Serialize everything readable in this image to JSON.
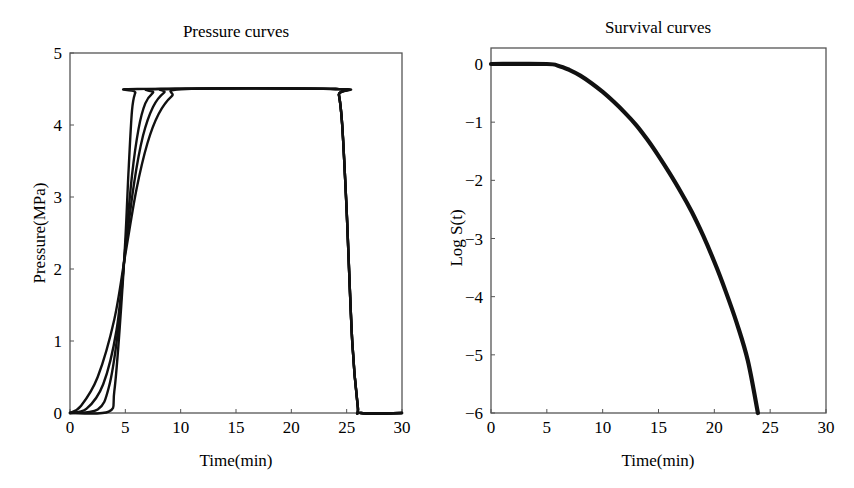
{
  "chart_data": [
    {
      "type": "line",
      "title": "Pressure curves",
      "xlabel": "Time(min)",
      "ylabel": "Pressure(MPa)",
      "xlim": [
        0,
        30
      ],
      "ylim": [
        0,
        5
      ],
      "xticks": [
        0,
        5,
        10,
        15,
        20,
        25,
        30
      ],
      "yticks": [
        0,
        1,
        2,
        3,
        4,
        5
      ],
      "grid": false,
      "legend": null,
      "series": [
        {
          "name": "curve 1 (fastest ramp)",
          "x": [
            0,
            3.5,
            4.0,
            4.5,
            5.0,
            5.3,
            5.6,
            5.9,
            6.2,
            24.0,
            24.3,
            24.6,
            25.0,
            25.5,
            26.0,
            26.3,
            30
          ],
          "y": [
            0,
            0.02,
            0.3,
            1.2,
            2.4,
            3.4,
            4.2,
            4.45,
            4.5,
            4.5,
            4.42,
            4.0,
            2.8,
            1.0,
            0.1,
            0,
            0
          ]
        },
        {
          "name": "curve 2",
          "x": [
            0,
            2.5,
            3.5,
            4.3,
            5.0,
            5.6,
            6.2,
            6.8,
            7.5,
            8.2,
            24.0,
            24.3,
            24.6,
            25.0,
            25.5,
            26.0,
            26.3,
            30
          ],
          "y": [
            0,
            0.05,
            0.35,
            1.1,
            2.3,
            3.3,
            3.95,
            4.3,
            4.45,
            4.5,
            4.5,
            4.42,
            4.0,
            2.8,
            1.0,
            0.1,
            0,
            0
          ]
        },
        {
          "name": "curve 3",
          "x": [
            0,
            1.5,
            3.0,
            4.2,
            5.0,
            5.8,
            6.6,
            7.5,
            8.5,
            9.5,
            24.0,
            24.3,
            24.6,
            25.0,
            25.5,
            26.0,
            26.3,
            30
          ],
          "y": [
            0,
            0.06,
            0.4,
            1.15,
            2.25,
            3.2,
            3.85,
            4.25,
            4.45,
            4.5,
            4.5,
            4.42,
            4.0,
            2.8,
            1.0,
            0.1,
            0,
            0
          ]
        },
        {
          "name": "curve 4 (slowest ramp)",
          "x": [
            0,
            1.0,
            2.5,
            4.0,
            5.0,
            6.0,
            7.0,
            8.0,
            9.2,
            10.5,
            24.0,
            24.3,
            24.6,
            25.0,
            25.5,
            26.0,
            26.3,
            30
          ],
          "y": [
            0,
            0.1,
            0.5,
            1.3,
            2.2,
            3.1,
            3.75,
            4.15,
            4.4,
            4.5,
            4.5,
            4.42,
            4.0,
            2.8,
            1.0,
            0.1,
            0,
            0
          ]
        }
      ]
    },
    {
      "type": "line",
      "title": "Survival curves",
      "xlabel": "Time(min)",
      "ylabel": "Log S(t)",
      "xlim": [
        0,
        30
      ],
      "ylim": [
        -6,
        0.28
      ],
      "xticks": [
        0,
        5,
        10,
        15,
        20,
        25,
        30
      ],
      "yticks": [
        0,
        -1,
        -2,
        -3,
        -4,
        -5,
        -6
      ],
      "grid": false,
      "legend": null,
      "series": [
        {
          "name": "survival (overlapping curves)",
          "x": [
            0,
            5,
            6,
            7,
            8,
            9,
            10,
            11,
            12,
            13,
            14,
            15,
            16,
            17,
            18,
            19,
            20,
            21,
            22,
            23,
            23.9
          ],
          "y": [
            0,
            0,
            -0.03,
            -0.1,
            -0.2,
            -0.33,
            -0.48,
            -0.65,
            -0.84,
            -1.05,
            -1.3,
            -1.58,
            -1.88,
            -2.2,
            -2.55,
            -2.95,
            -3.4,
            -3.9,
            -4.45,
            -5.1,
            -6.0
          ]
        }
      ]
    }
  ]
}
